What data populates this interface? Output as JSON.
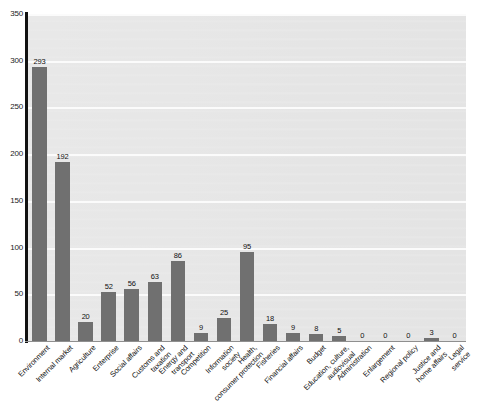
{
  "chart_data": {
    "type": "bar",
    "title": "",
    "subtitle": "",
    "xlabel": "",
    "ylabel": "",
    "ylim": [
      0,
      350
    ],
    "yticks": [
      0,
      50,
      100,
      150,
      200,
      250,
      300,
      350
    ],
    "grid": true,
    "legend": false,
    "legend_position": "none",
    "orientation": "vertical",
    "bar_color": "#707070",
    "plot_background": "#e7e7e7",
    "axis_color": "#111111",
    "gridline_color": "#fbfbfb",
    "value_labels_shown": true,
    "categories": [
      "Environment",
      "Internal market",
      "Agriculture",
      "Enterprise",
      "Social affairs",
      "Customs and taxation",
      "Energy and transport",
      "Competition",
      "Information society",
      "Health, consumer protection",
      "Fisheries",
      "Financial affairs",
      "Budget",
      "Education, culture, audiovisual",
      "Administration",
      "Enlargement",
      "Regional policy",
      "Justice and home affairs",
      "Legal service"
    ],
    "category_lines": [
      [
        "Environment"
      ],
      [
        "Internal market"
      ],
      [
        "Agriculture"
      ],
      [
        "Enterprise"
      ],
      [
        "Social affairs"
      ],
      [
        "Customs and",
        "taxation"
      ],
      [
        "Energy and",
        "transport"
      ],
      [
        "Competition"
      ],
      [
        "Information",
        "society"
      ],
      [
        "Health,",
        "consumer protection"
      ],
      [
        "Fisheries"
      ],
      [
        "Financial affairs"
      ],
      [
        "Budget"
      ],
      [
        "Education, culture,",
        "audiovisual"
      ],
      [
        "Administration"
      ],
      [
        "Enlargement"
      ],
      [
        "Regional policy"
      ],
      [
        "Justice and",
        "home affairs"
      ],
      [
        "Legal",
        "service"
      ]
    ],
    "values": [
      293,
      192,
      20,
      52,
      56,
      63,
      86,
      9,
      25,
      95,
      18,
      9,
      8,
      5,
      0,
      0,
      0,
      3,
      0
    ],
    "value_labels": [
      "293",
      "192",
      "20",
      "52",
      "56",
      "63",
      "86",
      "9",
      "25",
      "95",
      "18",
      "9",
      "8",
      "5",
      "0",
      "0",
      "0",
      "3",
      "0"
    ],
    "ytick_labels": [
      "0",
      "50",
      "100",
      "150",
      "200",
      "250",
      "300",
      "350"
    ]
  }
}
